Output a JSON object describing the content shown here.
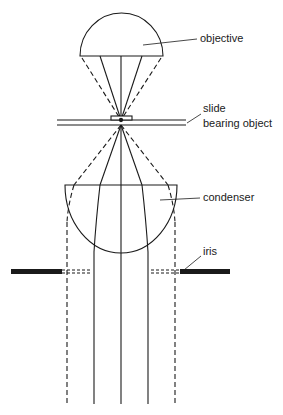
{
  "diagram": {
    "colors": {
      "ink": "#1a1a1a",
      "background": "#ffffff"
    },
    "labels": {
      "objective": "objective",
      "slide_line1": "slide",
      "slide_line2": "bearing object",
      "condenser": "condenser",
      "iris": "iris"
    },
    "components": [
      {
        "id": "objective",
        "shape": "half-dome (flat side down)"
      },
      {
        "id": "slide",
        "shape": "double horizontal line with object block"
      },
      {
        "id": "condenser",
        "shape": "half-dome (flat side up)"
      },
      {
        "id": "iris",
        "shape": "pair of thick horizontal bars with dashed aperture"
      }
    ],
    "rays": {
      "solid": 3,
      "dashed": 2
    }
  }
}
